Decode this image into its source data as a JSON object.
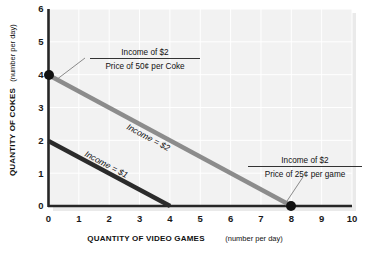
{
  "chart_data": {
    "type": "line",
    "title": "",
    "xlabel": "QUANTITY OF VIDEO GAMES",
    "xlabel_sub": "(number per day)",
    "ylabel": "QUANTITY OF COKES",
    "ylabel_sub": "(number per day)",
    "xlim": [
      0,
      10
    ],
    "ylim": [
      0,
      6
    ],
    "xticks": [
      "0",
      "1",
      "2",
      "3",
      "4",
      "5",
      "6",
      "7",
      "8",
      "9",
      "10"
    ],
    "yticks": [
      "0",
      "1",
      "2",
      "3",
      "4",
      "5",
      "6"
    ],
    "grid": true,
    "legend_position": "inline-labels",
    "series": [
      {
        "name": "Income = $2",
        "color": "#8c8c8c",
        "points": [
          [
            0,
            4
          ],
          [
            8,
            0
          ]
        ],
        "endpoint_markers": [
          [
            0,
            4
          ],
          [
            8,
            0
          ]
        ]
      },
      {
        "name": "Income = $1",
        "color": "#2b2b2b",
        "points": [
          [
            0,
            2
          ],
          [
            4,
            0
          ]
        ],
        "endpoint_markers": []
      }
    ],
    "annotations": [
      {
        "id": "coke-intercept",
        "numerator": "Income of $2",
        "denominator": "Price of 50¢ per Coke",
        "points_to": [
          0,
          4
        ]
      },
      {
        "id": "game-intercept",
        "numerator": "Income of $2",
        "denominator": "Price of 25¢ per game",
        "points_to": [
          8,
          0
        ]
      }
    ],
    "inline_labels": [
      {
        "id": "income-2-label",
        "text": "Income = $2"
      },
      {
        "id": "income-1-label",
        "text": "Income = $1"
      }
    ]
  },
  "colors": {
    "plot_background": "#f2f2f2",
    "gridline": "#ffffff",
    "axis": "#262626",
    "budget_line_2": "#8c8c8c",
    "budget_line_1": "#2b2b2b",
    "marker": "#111111",
    "leader": "#888888",
    "text": "#111111"
  }
}
